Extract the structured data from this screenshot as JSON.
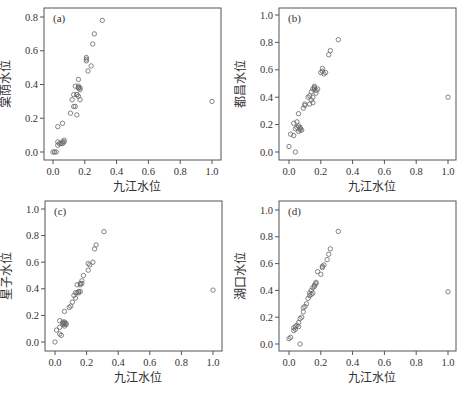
{
  "figure": {
    "background": "#ffffff",
    "frame_color": "#555555",
    "marker_color": "#666666"
  },
  "chart_data": [
    {
      "type": "scatter",
      "panel": "(a)",
      "title": "",
      "xlabel": "九江水位",
      "ylabel": "棠荫水位",
      "xlim": [
        0.0,
        1.0
      ],
      "ylim": [
        0.0,
        0.8
      ],
      "xticks": [
        "0.0",
        "0.2",
        "0.4",
        "0.6",
        "0.8",
        "1.0"
      ],
      "yticks": [
        "0.0",
        "0.2",
        "0.4",
        "0.6",
        "0.8"
      ],
      "grid": false,
      "frame": {
        "left": 44,
        "top": 8,
        "right": 221,
        "bottom": 160
      },
      "x0px": 53,
      "x1px": 212,
      "y0px": 152,
      "ytoppx": 17,
      "x": [
        0.0,
        0.01,
        0.02,
        0.03,
        0.03,
        0.04,
        0.05,
        0.06,
        0.06,
        0.07,
        0.07,
        0.03,
        0.06,
        0.11,
        0.12,
        0.13,
        0.13,
        0.14,
        0.14,
        0.15,
        0.15,
        0.16,
        0.16,
        0.16,
        0.17,
        0.17,
        0.16,
        0.15,
        0.16,
        0.17,
        0.21,
        0.21,
        0.21,
        0.22,
        0.24,
        0.25,
        0.26,
        0.31,
        1.0
      ],
      "y": [
        0.0,
        0.0,
        0.0,
        0.04,
        0.06,
        0.05,
        0.05,
        0.05,
        0.06,
        0.06,
        0.07,
        0.15,
        0.17,
        0.23,
        0.31,
        0.27,
        0.34,
        0.27,
        0.39,
        0.22,
        0.34,
        0.33,
        0.38,
        0.43,
        0.37,
        0.38,
        0.39,
        0.34,
        0.38,
        0.31,
        0.54,
        0.55,
        0.56,
        0.48,
        0.51,
        0.64,
        0.7,
        0.78,
        0.3
      ]
    },
    {
      "type": "scatter",
      "panel": "(b)",
      "title": "",
      "xlabel": "九江水位",
      "ylabel": "都昌水位",
      "xlim": [
        0.0,
        1.0
      ],
      "ylim": [
        0.0,
        1.0
      ],
      "xticks": [
        "0.0",
        "0.2",
        "0.4",
        "0.6",
        "0.8",
        "1.0"
      ],
      "yticks": [
        "0.0",
        "0.2",
        "0.4",
        "0.6",
        "0.8",
        "1.0"
      ],
      "grid": false,
      "frame": {
        "left": 279,
        "top": 8,
        "right": 456,
        "bottom": 160
      },
      "x0px": 289,
      "x1px": 448,
      "y0px": 152,
      "ytoppx": 15,
      "x": [
        0.0,
        0.01,
        0.03,
        0.04,
        0.03,
        0.04,
        0.05,
        0.05,
        0.06,
        0.06,
        0.07,
        0.07,
        0.08,
        0.07,
        0.06,
        0.09,
        0.1,
        0.1,
        0.12,
        0.13,
        0.13,
        0.14,
        0.14,
        0.15,
        0.15,
        0.16,
        0.16,
        0.17,
        0.17,
        0.18,
        0.16,
        0.15,
        0.2,
        0.21,
        0.21,
        0.22,
        0.23,
        0.25,
        0.26,
        0.31,
        1.0
      ],
      "y": [
        0.04,
        0.13,
        0.12,
        0.0,
        0.21,
        0.17,
        0.22,
        0.18,
        0.19,
        0.15,
        0.17,
        0.16,
        0.16,
        0.18,
        0.28,
        0.32,
        0.34,
        0.35,
        0.4,
        0.35,
        0.41,
        0.38,
        0.44,
        0.36,
        0.4,
        0.46,
        0.47,
        0.45,
        0.43,
        0.46,
        0.48,
        0.46,
        0.58,
        0.59,
        0.61,
        0.57,
        0.58,
        0.71,
        0.74,
        0.82,
        0.4
      ]
    },
    {
      "type": "scatter",
      "panel": "(c)",
      "title": "",
      "xlabel": "九江水位",
      "ylabel": "星子水位",
      "xlim": [
        0.0,
        1.0
      ],
      "ylim": [
        0.0,
        1.0
      ],
      "xticks": [
        "0.0",
        "0.2",
        "0.4",
        "0.6",
        "0.8",
        "1.0"
      ],
      "yticks": [
        "0.0",
        "0.2",
        "0.4",
        "0.6",
        "0.8",
        "1.0"
      ],
      "grid": false,
      "frame": {
        "left": 45,
        "top": 201,
        "right": 222,
        "bottom": 351
      },
      "x0px": 55,
      "x1px": 213,
      "y0px": 342,
      "ytoppx": 209,
      "x": [
        0.0,
        0.01,
        0.03,
        0.03,
        0.04,
        0.03,
        0.05,
        0.05,
        0.06,
        0.06,
        0.07,
        0.07,
        0.06,
        0.05,
        0.06,
        0.09,
        0.1,
        0.11,
        0.12,
        0.13,
        0.14,
        0.13,
        0.14,
        0.15,
        0.15,
        0.16,
        0.16,
        0.16,
        0.17,
        0.17,
        0.18,
        0.21,
        0.21,
        0.22,
        0.24,
        0.25,
        0.26,
        0.31,
        1.0
      ],
      "y": [
        0.0,
        0.09,
        0.06,
        0.16,
        0.05,
        0.11,
        0.15,
        0.13,
        0.14,
        0.15,
        0.14,
        0.13,
        0.12,
        0.14,
        0.23,
        0.26,
        0.27,
        0.3,
        0.35,
        0.33,
        0.37,
        0.37,
        0.43,
        0.38,
        0.37,
        0.43,
        0.44,
        0.38,
        0.46,
        0.44,
        0.5,
        0.54,
        0.59,
        0.58,
        0.6,
        0.7,
        0.73,
        0.83,
        0.39
      ]
    },
    {
      "type": "scatter",
      "panel": "(d)",
      "title": "",
      "xlabel": "九江水位",
      "ylabel": "湖口水位",
      "xlim": [
        0.0,
        1.0
      ],
      "ylim": [
        0.0,
        1.0
      ],
      "xticks": [
        "0.0",
        "0.2",
        "0.4",
        "0.6",
        "0.8",
        "1.0"
      ],
      "yticks": [
        "0.0",
        "0.2",
        "0.4",
        "0.6",
        "0.8",
        "1.0"
      ],
      "grid": false,
      "frame": {
        "left": 279,
        "top": 201,
        "right": 456,
        "bottom": 351
      },
      "x0px": 289,
      "x1px": 448,
      "y0px": 344,
      "ytoppx": 210,
      "x": [
        0.0,
        0.01,
        0.03,
        0.03,
        0.04,
        0.04,
        0.05,
        0.06,
        0.06,
        0.07,
        0.07,
        0.08,
        0.09,
        0.09,
        0.1,
        0.11,
        0.12,
        0.13,
        0.13,
        0.14,
        0.14,
        0.15,
        0.15,
        0.16,
        0.16,
        0.17,
        0.17,
        0.18,
        0.2,
        0.21,
        0.21,
        0.22,
        0.24,
        0.25,
        0.26,
        0.31,
        1.0
      ],
      "y": [
        0.04,
        0.05,
        0.1,
        0.12,
        0.11,
        0.13,
        0.14,
        0.13,
        0.16,
        0.19,
        0.0,
        0.2,
        0.24,
        0.27,
        0.28,
        0.3,
        0.34,
        0.36,
        0.38,
        0.37,
        0.4,
        0.38,
        0.42,
        0.44,
        0.43,
        0.45,
        0.46,
        0.54,
        0.52,
        0.57,
        0.58,
        0.59,
        0.63,
        0.67,
        0.71,
        0.84,
        0.39
      ]
    }
  ]
}
